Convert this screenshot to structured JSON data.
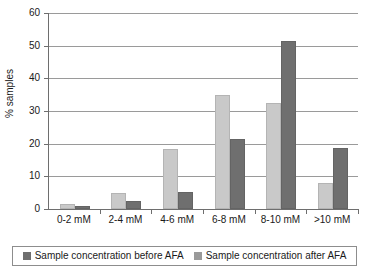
{
  "chart_data": {
    "type": "bar",
    "title": "",
    "subtitle": "",
    "xlabel": "",
    "ylabel": "% samples",
    "ylim": [
      0,
      60
    ],
    "yticks": [
      0,
      10,
      20,
      30,
      40,
      50,
      60
    ],
    "grid": true,
    "legend_position": "bottom",
    "categories": [
      "0-2 mM",
      "2-4 mM",
      "4-6 mM",
      "6-8 mM",
      "8-10 mM",
      ">10 mM"
    ],
    "series": [
      {
        "name": "Sample concentration before AFA",
        "color": "#c9c9c9",
        "values": [
          1.5,
          4.8,
          18.5,
          35.0,
          32.5,
          8.0
        ]
      },
      {
        "name": "Sample concentration after AFA",
        "color": "#6f6f6f",
        "values": [
          1.0,
          2.4,
          5.2,
          21.5,
          51.5,
          18.8
        ]
      }
    ]
  },
  "legend": {
    "items": [
      {
        "label": "Sample concentration before AFA",
        "swatch": "legend-swatch-before"
      },
      {
        "label": "Sample concentration after AFA",
        "swatch": "legend-swatch-after"
      }
    ]
  },
  "axes": {
    "y_label": "% samples",
    "y_tick_labels": [
      "60",
      "50",
      "40",
      "30",
      "20",
      "10",
      "0"
    ],
    "x_tick_labels": [
      "0-2 mM",
      "2-4 mM",
      "4-6 mM",
      "6-8 mM",
      "8-10 mM",
      ">10 mM"
    ]
  },
  "colors": {
    "before": "#c9c9c9",
    "after": "#6f6f6f",
    "grid": "#9a9a9a",
    "axis": "#6e6e6e",
    "background": "#ffffff",
    "text": "#1a1a1a"
  }
}
